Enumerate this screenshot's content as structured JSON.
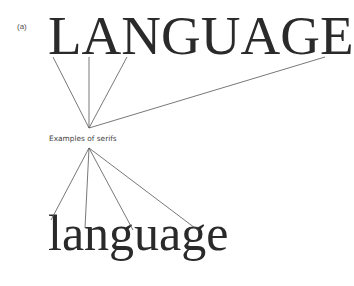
{
  "figure_label": "(a)",
  "uppercase_word": "LANGUAGE",
  "caption": "Examples of serifs",
  "lowercase_word": "language",
  "line_color": "#555555"
}
